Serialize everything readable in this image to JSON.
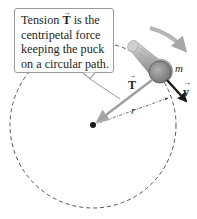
{
  "callout": {
    "lines": [
      "Tension ",
      " is the",
      "centripetal force",
      "keeping the puck",
      "on a circular path."
    ],
    "vector_symbol": "T",
    "arrow": "→"
  },
  "labels": {
    "tension": "T",
    "velocity": "v",
    "mass": "m",
    "radius": "r",
    "arrow": "→"
  },
  "geometry": {
    "center": [
      93,
      125
    ],
    "radius": 83,
    "puck_center": [
      160,
      72
    ]
  },
  "colors": {
    "circle": "#555555",
    "tension_arrow": "#a8a8a8",
    "velocity_arrow": "#1a1a1a",
    "puck": "#8c8c8c",
    "rotation_arrow": "#b5b5b5"
  }
}
